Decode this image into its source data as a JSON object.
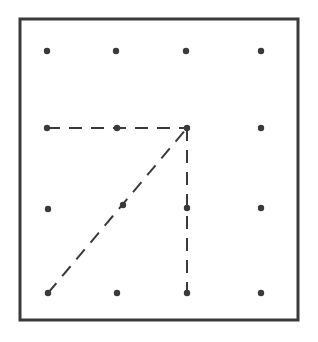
{
  "diagram": {
    "type": "geoboard",
    "frame": {
      "x": 20,
      "y": 19,
      "width": 278,
      "height": 301,
      "stroke": "#3a3a3a",
      "stroke_width": 3
    },
    "dot_color": "#3a3a3a",
    "dot_radius": 3.2,
    "grid": {
      "columns": 4,
      "rows": 4
    },
    "dots": [
      {
        "x": 47,
        "y": 51
      },
      {
        "x": 116,
        "y": 51
      },
      {
        "x": 186,
        "y": 51
      },
      {
        "x": 261,
        "y": 51
      },
      {
        "x": 47,
        "y": 128
      },
      {
        "x": 117,
        "y": 128
      },
      {
        "x": 187,
        "y": 128
      },
      {
        "x": 261,
        "y": 128
      },
      {
        "x": 48,
        "y": 209
      },
      {
        "x": 123,
        "y": 205
      },
      {
        "x": 187,
        "y": 208
      },
      {
        "x": 261,
        "y": 208
      },
      {
        "x": 48,
        "y": 293
      },
      {
        "x": 117,
        "y": 293
      },
      {
        "x": 187,
        "y": 293
      },
      {
        "x": 261,
        "y": 293
      }
    ],
    "dashed_lines": [
      {
        "name": "horizontal-segment",
        "x1": 47,
        "y1": 128,
        "x2": 187,
        "y2": 128
      },
      {
        "name": "vertical-segment",
        "x1": 187,
        "y1": 128,
        "x2": 187,
        "y2": 293
      },
      {
        "name": "diagonal-segment",
        "x1": 48,
        "y1": 293,
        "x2": 187,
        "y2": 128
      }
    ],
    "line_style": {
      "stroke": "#3a3a3a",
      "stroke_width": 2,
      "dasharray": "13,9"
    }
  }
}
